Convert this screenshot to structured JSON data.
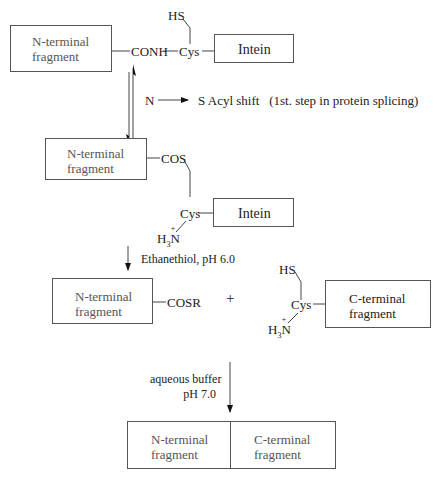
{
  "diagram": {
    "step1": {
      "n_fragment_label_line1": "N-terminal",
      "n_fragment_label_line2": "fragment",
      "linkage": "CONH",
      "residue": "Cys",
      "side_chain": "HS",
      "intein_label": "Intein"
    },
    "equilibrium": {
      "from": "N",
      "to_label": "S Acyl shift",
      "note": "(1st. step in protein splicing)"
    },
    "step2": {
      "n_fragment_label_line1": "N-terminal",
      "n_fragment_label_line2": "fragment",
      "linkage": "COS",
      "residue": "Cys",
      "amine": "H",
      "amine_sub": "3",
      "amine_N": "N",
      "amine_charge": "+",
      "intein_label": "Intein"
    },
    "reaction1": {
      "condition": "Ethanethiol, pH 6.0"
    },
    "step3": {
      "n_fragment_label_line1": "N-terminal",
      "n_fragment_label_line2": "fragment",
      "thioester": "COSR",
      "plus": "+",
      "side_chain": "HS",
      "residue": "Cys",
      "amine": "H",
      "amine_sub": "3",
      "amine_N": "N",
      "amine_charge": "+",
      "c_fragment_label_line1": "C-terminal",
      "c_fragment_label_line2": "fragment"
    },
    "reaction2": {
      "condition_line1": "aqueous buffer",
      "condition_line2": "pH 7.0"
    },
    "product": {
      "n_fragment_label_line1": "N-terminal",
      "n_fragment_label_line2": "fragment",
      "c_fragment_label_line1": "C-terminal",
      "c_fragment_label_line2": "fragment"
    }
  }
}
